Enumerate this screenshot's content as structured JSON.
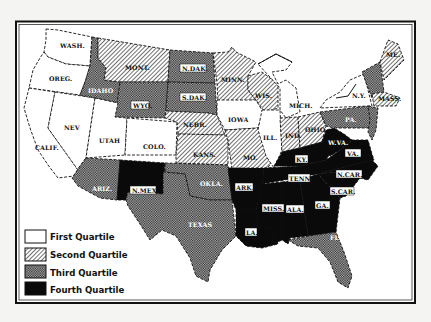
{
  "map": {
    "title": "United States by quartile",
    "colors": {
      "background": "#f4f4f2",
      "frame": "#111111",
      "first": "#ffffff",
      "fourth": "#0a0a0a",
      "ink": "#111111"
    },
    "states": [
      {
        "id": "wash",
        "label": "WASH.",
        "quartile": 1
      },
      {
        "id": "oreg",
        "label": "OREG.",
        "quartile": 1
      },
      {
        "id": "calif",
        "label": "CALIF.",
        "quartile": 1
      },
      {
        "id": "nev",
        "label": "NEV",
        "quartile": 1
      },
      {
        "id": "idaho",
        "label": "IDAHO",
        "quartile": 3
      },
      {
        "id": "mont",
        "label": "MONT.",
        "quartile": 2
      },
      {
        "id": "wyo",
        "label": "WYO.",
        "quartile": 3
      },
      {
        "id": "utah",
        "label": "UTAH",
        "quartile": 1
      },
      {
        "id": "colo",
        "label": "COLO.",
        "quartile": 1
      },
      {
        "id": "ariz",
        "label": "ARIZ.",
        "quartile": 3
      },
      {
        "id": "nmex",
        "label": "N.MEX.",
        "quartile": 4
      },
      {
        "id": "ndak",
        "label": "N.DAK.",
        "quartile": 3
      },
      {
        "id": "sdak",
        "label": "S.DAK.",
        "quartile": 3
      },
      {
        "id": "nebr",
        "label": "NEBR.",
        "quartile": 2
      },
      {
        "id": "kans",
        "label": "KANS.",
        "quartile": 2
      },
      {
        "id": "okla",
        "label": "OKLA.",
        "quartile": 3
      },
      {
        "id": "texas",
        "label": "TEXAS",
        "quartile": 3
      },
      {
        "id": "minn",
        "label": "MINN.",
        "quartile": 2
      },
      {
        "id": "iowa",
        "label": "IOWA",
        "quartile": 1
      },
      {
        "id": "mo",
        "label": "MO.",
        "quartile": 2
      },
      {
        "id": "ark",
        "label": "ARK.",
        "quartile": 4
      },
      {
        "id": "la",
        "label": "LA.",
        "quartile": 4
      },
      {
        "id": "wis",
        "label": "WIS.",
        "quartile": 2
      },
      {
        "id": "ill",
        "label": "ILL.",
        "quartile": 1
      },
      {
        "id": "mich",
        "label": "MICH.",
        "quartile": 1
      },
      {
        "id": "ind",
        "label": "IND.",
        "quartile": 2
      },
      {
        "id": "ohio",
        "label": "OHIO",
        "quartile": 2
      },
      {
        "id": "ky",
        "label": "KY.",
        "quartile": 4
      },
      {
        "id": "tenn",
        "label": "TENN.",
        "quartile": 4
      },
      {
        "id": "miss",
        "label": "MISS.",
        "quartile": 4
      },
      {
        "id": "ala",
        "label": "ALA.",
        "quartile": 4
      },
      {
        "id": "ga",
        "label": "GA.",
        "quartile": 4
      },
      {
        "id": "fla",
        "label": "FLA.",
        "quartile": 3
      },
      {
        "id": "scar",
        "label": "S.CAR.",
        "quartile": 4
      },
      {
        "id": "ncar",
        "label": "N.CAR.",
        "quartile": 4
      },
      {
        "id": "va",
        "label": "VA.",
        "quartile": 4
      },
      {
        "id": "wva",
        "label": "W.VA.",
        "quartile": 4
      },
      {
        "id": "pa",
        "label": "PA.",
        "quartile": 3
      },
      {
        "id": "ny",
        "label": "N.Y.",
        "quartile": 1
      },
      {
        "id": "me",
        "label": "ME.",
        "quartile": 2
      },
      {
        "id": "nh_vt",
        "label": "",
        "quartile": 3
      },
      {
        "id": "mass",
        "label": "MASS.",
        "quartile": 2
      },
      {
        "id": "nj_md_del",
        "label": "",
        "quartile": 3
      }
    ]
  },
  "legend": {
    "items": [
      {
        "label": "First Quartile",
        "fill": "first"
      },
      {
        "label": "Second Quartile",
        "fill": "second"
      },
      {
        "label": "Third Quartile",
        "fill": "third"
      },
      {
        "label": "Fourth Quartile",
        "fill": "fourth"
      }
    ]
  },
  "labels": {
    "wash": "WASH.",
    "oreg": "OREG.",
    "calif": "CALIF.",
    "nev": "NEV",
    "idaho": "IDAHO",
    "mont": "MONT.",
    "wyo": "WYO.",
    "utah": "UTAH",
    "colo": "COLO.",
    "ariz": "ARIZ.",
    "nmex": "N.MEX.",
    "ndak": "N.DAK.",
    "sdak": "S.DAK.",
    "nebr": "NEBR.",
    "kans": "KANS.",
    "okla": "OKLA.",
    "texas": "TEXAS",
    "minn": "MINN.",
    "iowa": "IOWA",
    "mo": "MO.",
    "ark": "ARK.",
    "la": "LA.",
    "wis": "WIS.",
    "ill": "ILL.",
    "mich": "MICH.",
    "ind": "IND.",
    "ohio": "OHIO",
    "ky": "KY.",
    "tenn": "TENN.",
    "miss": "MISS.",
    "ala": "ALA.",
    "ga": "GA.",
    "fla": "FLA.",
    "scar": "S.CAR.",
    "ncar": "N.CAR.",
    "va": "VA.",
    "wva": "W.VA.",
    "pa": "PA.",
    "ny": "N.Y.",
    "me": "ME.",
    "mass": "MASS."
  }
}
